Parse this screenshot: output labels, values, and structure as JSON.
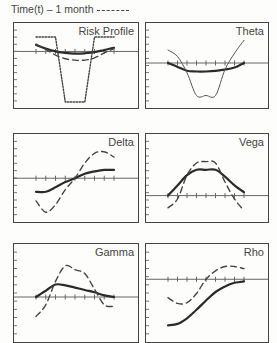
{
  "legend": {
    "text": "Time(t) – 1 month",
    "dashed_series_name": "Time(t) - 1 month",
    "solid_series_name": "Time(t)"
  },
  "chart_data": [
    {
      "type": "line",
      "title": "Risk Profile",
      "x": [
        0,
        1,
        2,
        3,
        4,
        5,
        6,
        7,
        8
      ],
      "ylim": [
        -7,
        2
      ],
      "series": [
        {
          "name": "Time(t)",
          "style": "solid",
          "values": [
            0.9,
            0.4,
            0.0,
            -0.2,
            -0.3,
            -0.25,
            -0.1,
            0.2,
            0.5
          ]
        },
        {
          "name": "Time(t) - 1 month",
          "style": "dashed",
          "values": [
            1.0,
            0.3,
            -0.5,
            -1.0,
            -1.2,
            -1.2,
            -0.9,
            -0.2,
            0.4
          ]
        },
        {
          "name": "Payoff",
          "style": "dotted",
          "values": [
            2.0,
            2.0,
            2.0,
            -7.0,
            -7.0,
            -7.0,
            2.0,
            2.0,
            2.0
          ]
        }
      ]
    },
    {
      "type": "line",
      "title": "Theta",
      "x": [
        0,
        1,
        2,
        3,
        4,
        5,
        6,
        7,
        8
      ],
      "ylim": [
        -6,
        4
      ],
      "series": [
        {
          "name": "Time(t)",
          "style": "solid",
          "values": [
            0.0,
            -0.6,
            -1.2,
            -1.3,
            -1.3,
            -1.2,
            -1.0,
            -0.7,
            0.0
          ]
        },
        {
          "name": "Time(t) - 1 month",
          "style": "thin",
          "values": [
            2.0,
            1.0,
            -1.5,
            -5.0,
            -5.0,
            -5.0,
            -1.0,
            1.5,
            3.5
          ]
        }
      ]
    },
    {
      "type": "line",
      "title": "Delta",
      "x": [
        0,
        1,
        2,
        3,
        4,
        5,
        6,
        7,
        8
      ],
      "ylim": [
        -5,
        4
      ],
      "series": [
        {
          "name": "Time(t)",
          "style": "solid",
          "values": [
            -1.8,
            -1.8,
            -1.2,
            -0.5,
            0.0,
            0.6,
            0.9,
            1.1,
            1.1
          ]
        },
        {
          "name": "Time(t) - 1 month",
          "style": "dashed",
          "values": [
            -3.0,
            -4.5,
            -3.5,
            -1.5,
            0.0,
            2.0,
            3.3,
            3.5,
            2.8
          ]
        }
      ]
    },
    {
      "type": "line",
      "title": "Vega",
      "x": [
        0,
        1,
        2,
        3,
        4,
        5,
        6,
        7,
        8
      ],
      "ylim": [
        -3,
        7
      ],
      "series": [
        {
          "name": "Time(t)",
          "style": "solid",
          "values": [
            0.0,
            1.5,
            3.0,
            3.8,
            3.8,
            3.8,
            2.8,
            1.5,
            0.5
          ]
        },
        {
          "name": "Time(t) - 1 month",
          "style": "dashed",
          "values": [
            -1.8,
            -0.5,
            3.0,
            4.8,
            5.0,
            4.8,
            2.0,
            -0.5,
            -2.2
          ]
        }
      ]
    },
    {
      "type": "line",
      "title": "Gamma",
      "x": [
        0,
        1,
        2,
        3,
        4,
        5,
        6,
        7,
        8
      ],
      "ylim": [
        -5,
        5
      ],
      "series": [
        {
          "name": "Time(t)",
          "style": "solid",
          "values": [
            0.0,
            0.8,
            1.6,
            1.5,
            1.2,
            0.9,
            0.6,
            0.2,
            0.0
          ]
        },
        {
          "name": "Time(t) - 1 month",
          "style": "dashed",
          "values": [
            -2.5,
            -1.0,
            2.0,
            4.0,
            3.5,
            3.0,
            1.0,
            -1.0,
            -1.2
          ]
        }
      ]
    },
    {
      "type": "line",
      "title": "Rho",
      "x": [
        0,
        1,
        2,
        3,
        4,
        5,
        6,
        7,
        8
      ],
      "ylim": [
        -8,
        3
      ],
      "series": [
        {
          "name": "Time(t)",
          "style": "solid",
          "values": [
            -6.5,
            -6.3,
            -5.5,
            -4.3,
            -3.0,
            -1.8,
            -1.0,
            -0.5,
            -0.3
          ]
        },
        {
          "name": "Time(t) - 1 month",
          "style": "dashed",
          "values": [
            -2.6,
            -3.4,
            -3.3,
            -2.0,
            0.0,
            1.2,
            1.8,
            1.8,
            1.5
          ]
        }
      ]
    }
  ]
}
